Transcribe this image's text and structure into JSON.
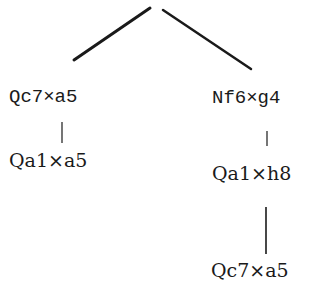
{
  "diagram": {
    "type": "move-tree",
    "colors": {
      "ink": "#1a1a1a",
      "background": "#ffffff"
    },
    "nodes": [
      {
        "id": "root",
        "label": ""
      },
      {
        "id": "left_1",
        "label": "Qc7×a5",
        "parent": "root"
      },
      {
        "id": "left_2",
        "label": "Qa1×a5",
        "parent": "left_1"
      },
      {
        "id": "right_1",
        "label": "Nf6×g4",
        "parent": "root"
      },
      {
        "id": "right_2",
        "label": "Qa1×h8",
        "parent": "right_1"
      },
      {
        "id": "right_3",
        "label": "Qc7×a5",
        "parent": "right_2"
      }
    ],
    "labels": {
      "left_1": "Qc7×a5",
      "left_2": "Qa1×a5",
      "right_1": "Nf6×g4",
      "right_2": "Qa1×h8",
      "right_3": "Qc7×a5"
    }
  }
}
